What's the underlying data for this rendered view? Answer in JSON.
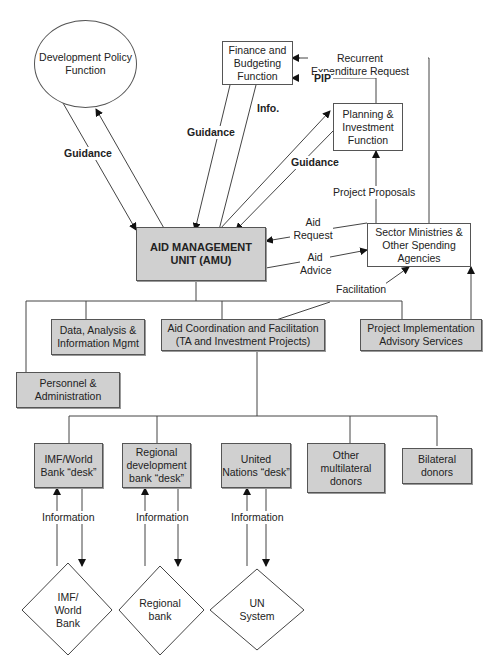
{
  "nodes": {
    "dev_policy": "Development Policy Function",
    "finance": "Finance and Budgeting Function",
    "planning": "Planning & Investment Function",
    "amu": "AID MANAGEMENT UNIT (AMU)",
    "sector": "Sector Ministries & Other Spending Agencies",
    "data": "Data, Analysis & Information Mgmt",
    "aid_coord": "Aid Coordination and Facilitation (TA and Investment Projects)",
    "project_impl": "Project Implementation Advisory Services",
    "personnel": "Personnel & Administration",
    "imf_desk": "IMF/World Bank “desk”",
    "regional_desk": "Regional development bank “desk”",
    "un_desk": "United Nations “desk”",
    "other_multilateral": "Other multilateral donors",
    "bilateral": "Bilateral donors",
    "imf_wb": "IMF/ World Bank",
    "regional_bank": "Regional bank",
    "un_system": "UN System"
  },
  "edge_labels": {
    "guidance_left": "Guidance",
    "guidance_finance": "Guidance",
    "info": "Info.",
    "guidance_planning": "Guidance",
    "recurrent": "Recurrent Expenditure Request",
    "pip": "PIP",
    "project_proposals": "Project Proposals",
    "aid_request": "Aid Request",
    "aid_advice": "Aid Advice",
    "facilitation": "Facilitation",
    "information_1": "Information",
    "information_2": "Information",
    "information_3": "Information"
  }
}
